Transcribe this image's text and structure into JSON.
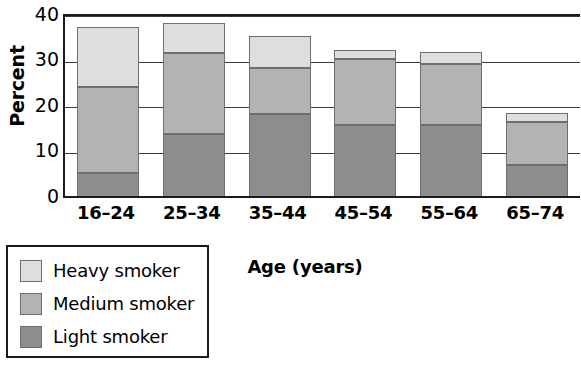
{
  "chart_data": {
    "type": "bar",
    "stacked": true,
    "title": "",
    "xlabel": "Age (years)",
    "ylabel": "Percent",
    "categories": [
      "16–24",
      "25–34",
      "35–44",
      "45–54",
      "55–64",
      "65–74"
    ],
    "ylim": [
      0,
      40
    ],
    "yticks": [
      0,
      10,
      20,
      30,
      40
    ],
    "ytick_labels": [
      "0",
      "10",
      "20",
      "30",
      "40"
    ],
    "grid": true,
    "legend_position": "below-left",
    "series": [
      {
        "name": "Light smoker",
        "color": "#8d8d8d",
        "values": [
          5.5,
          14.0,
          18.5,
          16.0,
          16.0,
          7.3
        ]
      },
      {
        "name": "Medium smoker",
        "color": "#b3b3b3",
        "values": [
          19.0,
          17.8,
          10.0,
          14.5,
          13.5,
          9.4
        ]
      },
      {
        "name": "Heavy smoker",
        "color": "#dedede",
        "values": [
          13.0,
          6.7,
          7.0,
          2.0,
          2.5,
          2.0
        ]
      }
    ],
    "totals": [
      37.5,
      38.5,
      35.5,
      32.5,
      32.0,
      18.7
    ]
  },
  "legend": {
    "items": [
      {
        "label": "Heavy smoker",
        "color": "#dedede"
      },
      {
        "label": "Medium smoker",
        "color": "#b3b3b3"
      },
      {
        "label": "Light smoker",
        "color": "#8d8d8d"
      }
    ]
  },
  "colors": {
    "axis": "#1a1a1a",
    "grid": "#3a3a3a",
    "bar_border": "#6e6e6e",
    "background": "#ffffff"
  }
}
